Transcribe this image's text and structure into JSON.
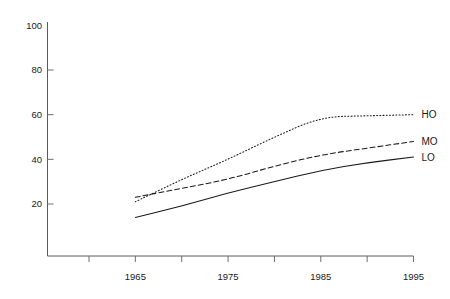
{
  "chart_data": {
    "type": "line",
    "title": "",
    "subtitle": "",
    "xlabel": "",
    "ylabel": "",
    "xlim": [
      1960,
      1995
    ],
    "ylim": [
      0,
      100
    ],
    "grid": false,
    "legend_position": "right-inline-labels",
    "x_ticks": [
      1960,
      1965,
      1970,
      1975,
      1980,
      1985,
      1990,
      1995
    ],
    "x_tick_labels": [
      "",
      "1965",
      "",
      "1975",
      "",
      "1985",
      "",
      "1995"
    ],
    "y_ticks": [
      20,
      40,
      60,
      80,
      100
    ],
    "y_tick_labels": [
      "20",
      "40",
      "60",
      "80",
      "100"
    ],
    "x": [
      1965,
      1970,
      1975,
      1980,
      1985,
      1990,
      1995
    ],
    "series": [
      {
        "name": "HO",
        "label": "HO",
        "style": "dotted",
        "color": "#1a1a1a",
        "values": [
          21,
          31,
          40,
          50,
          59,
          59.5,
          60
        ]
      },
      {
        "name": "MO",
        "label": "MO",
        "style": "dashed",
        "color": "#1a1a1a",
        "values": [
          23,
          27,
          31,
          37,
          42,
          45,
          48
        ]
      },
      {
        "name": "LO",
        "label": "LO",
        "style": "solid",
        "color": "#1a1a1a",
        "values": [
          14,
          19,
          25,
          30,
          35,
          38.5,
          41
        ]
      }
    ],
    "axis_color": "#5a5a5a",
    "text_color": "#1a1a1a",
    "background": "#ffffff"
  }
}
